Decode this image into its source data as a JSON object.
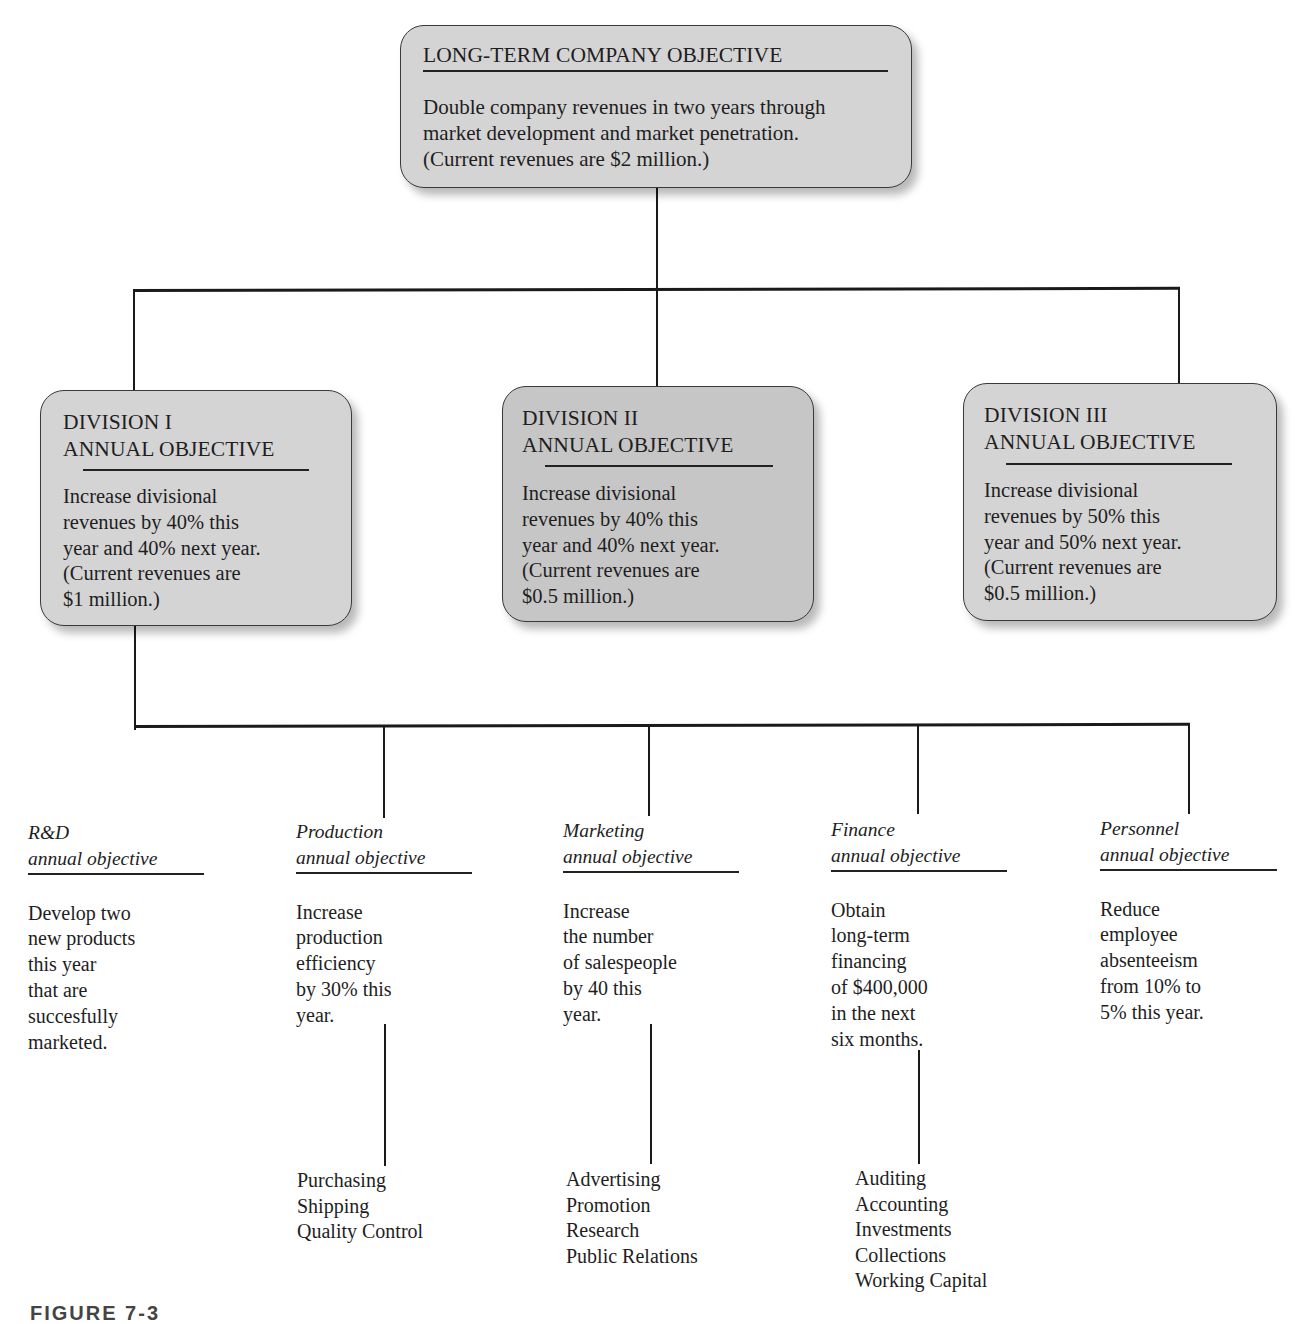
{
  "company_objective": {
    "title": "LONG-TERM COMPANY OBJECTIVE",
    "text": "Double company revenues in two years through\nmarket development and market penetration.\n(Current revenues are $2 million.)"
  },
  "divisions": [
    {
      "title": "DIVISION  I\nANNUAL OBJECTIVE",
      "text": "Increase divisional\nrevenues by 40% this\nyear and 40% next year.\n(Current revenues are\n$1 million.)"
    },
    {
      "title": "DIVISION  II\nANNUAL OBJECTIVE",
      "text": "Increase divisional\nrevenues by 40% this\nyear and 40% next year.\n(Current revenues are\n$0.5 million.)"
    },
    {
      "title": "DIVISION  III\nANNUAL OBJECTIVE",
      "text": "Increase divisional\nrevenues by 50% this\nyear and 50% next year.\n(Current revenues are\n$0.5 million.)"
    }
  ],
  "functional_objectives": [
    {
      "heading": "R&D\nannual objective",
      "text": "Develop two\nnew products\nthis year\nthat are\nsuccesfully\nmarketed."
    },
    {
      "heading": "Production\nannual objective",
      "text": "Increase\nproduction\nefficiency\nby 30% this\nyear.",
      "sub_units": [
        "Purchasing",
        "Shipping",
        "Quality Control"
      ]
    },
    {
      "heading": "Marketing\nannual objective",
      "text": "Increase\nthe number\nof salespeople\nby 40 this\nyear.",
      "sub_units": [
        "Advertising",
        "Promotion",
        "Research",
        "Public Relations"
      ]
    },
    {
      "heading": "Finance\nannual objective",
      "text": "Obtain\nlong-term\nfinancing\nof $400,000\nin the next\nsix months.",
      "sub_units": [
        "Auditing",
        "Accounting",
        "Investments",
        "Collections",
        "Working Capital"
      ]
    },
    {
      "heading": "Personnel\nannual objective",
      "text": "Reduce\nemployee\nabsenteeism\nfrom 10% to\n5% this year."
    }
  ],
  "figure_label": "FIGURE 7-3"
}
